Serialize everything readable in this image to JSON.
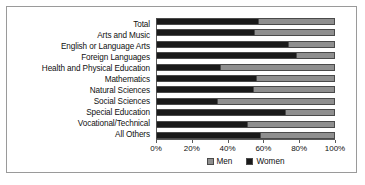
{
  "chart_data": {
    "type": "bar",
    "orientation": "horizontal",
    "stacked": true,
    "stack_total": 100,
    "title": "",
    "subtitle": "",
    "xlabel": "",
    "ylabel": "",
    "xlim": [
      0,
      100
    ],
    "grid": false,
    "legend_position": "bottom-center",
    "categories": [
      "Total",
      "Arts and Music",
      "English or Language Arts",
      "Foreign Languages",
      "Health and Physical Education",
      "Mathematics",
      "Natural Sciences",
      "Social Sciences",
      "Special Education",
      "Vocational/Technical",
      "All Others"
    ],
    "tick_labels": [
      "0%",
      "20%",
      "40%",
      "60%",
      "80%",
      "100%"
    ],
    "tick_values": [
      0,
      20,
      40,
      60,
      80,
      100
    ],
    "series": [
      {
        "name": "Women",
        "color": "#1a1a1a",
        "draw_order": 1,
        "values": [
          57,
          55,
          74,
          78,
          36,
          56,
          54,
          34,
          72,
          51,
          58
        ]
      },
      {
        "name": "Men",
        "color": "#8f8f8f",
        "draw_order": 2,
        "values": [
          43,
          45,
          26,
          22,
          64,
          44,
          46,
          66,
          28,
          49,
          42
        ]
      }
    ],
    "legend": [
      {
        "label": "Men",
        "color": "#8f8f8f"
      },
      {
        "label": "Women",
        "color": "#1a1a1a"
      }
    ]
  },
  "frame": {
    "border_color": "#9a9a9a",
    "background": "#ffffff"
  }
}
